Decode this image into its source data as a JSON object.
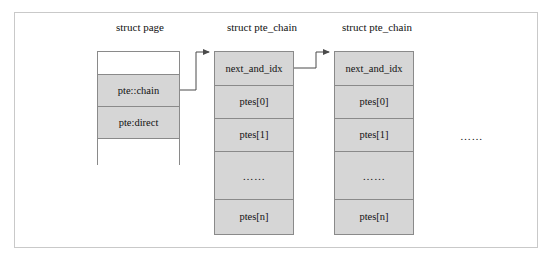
{
  "figure": {
    "title_columns": [
      {
        "label": "struct page"
      },
      {
        "label": "struct pte_chain"
      },
      {
        "label": "struct pte_chain"
      }
    ],
    "trailing_ellipsis": "……"
  },
  "struct_page": {
    "caption": "struct page",
    "cells": [
      {
        "label": "",
        "filled": false
      },
      {
        "label": "pte::chain",
        "filled": true
      },
      {
        "label": "pte:direct",
        "filled": true
      },
      {
        "label": "",
        "filled": false
      }
    ]
  },
  "pte_chain_1": {
    "caption": "struct pte_chain",
    "cells": [
      {
        "label": "next_and_idx",
        "filled": true
      },
      {
        "label": "ptes[0]",
        "filled": true
      },
      {
        "label": "ptes[1]",
        "filled": true
      },
      {
        "label": "……",
        "filled": true
      },
      {
        "label": "ptes[n]",
        "filled": true
      }
    ]
  },
  "pte_chain_2": {
    "caption": "struct pte_chain",
    "cells": [
      {
        "label": "next_and_idx",
        "filled": true
      },
      {
        "label": "ptes[0]",
        "filled": true
      },
      {
        "label": "ptes[1]",
        "filled": true
      },
      {
        "label": "……",
        "filled": true
      },
      {
        "label": "ptes[n]",
        "filled": true
      }
    ]
  },
  "colors": {
    "cell_fill": "#d6d6d6",
    "box_border": "#8a8a8a",
    "frame_border": "#c9c9c9",
    "connector": "#4a4a4a",
    "text": "#111111"
  },
  "connectors": [
    {
      "name": "page-chain-to-pte-chain-1",
      "from": "pte::chain",
      "to": "struct pte_chain #1 next_and_idx"
    },
    {
      "name": "pte-chain-1-to-pte-chain-2",
      "from": "next_and_idx #1",
      "to": "struct pte_chain #2 next_and_idx"
    }
  ]
}
